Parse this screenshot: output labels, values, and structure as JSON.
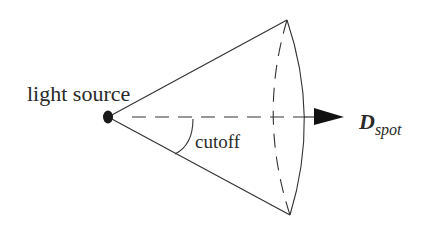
{
  "diagram": {
    "type": "spotlight-cone",
    "labels": {
      "light_source": "light source",
      "cutoff": "cutoff",
      "direction_main": "D",
      "direction_sub": "spot"
    },
    "colors": {
      "stroke": "#2a2a2a",
      "background": "#ffffff"
    }
  }
}
